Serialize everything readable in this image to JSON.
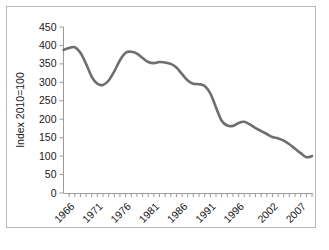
{
  "chart_data": {
    "type": "line",
    "title": "",
    "subtitle": "",
    "xlabel": "",
    "ylabel": "Index 2010=100",
    "ylim": [
      0,
      450
    ],
    "ytick_step": 50,
    "yticks": [
      "0",
      "50",
      "100",
      "150",
      "200",
      "250",
      "300",
      "350",
      "400",
      "450"
    ],
    "xlim": [
      1965,
      2009
    ],
    "xticks_labeled": [
      "1966",
      "1971",
      "1976",
      "1981",
      "1986",
      "1991",
      "1996",
      "2002",
      "2007"
    ],
    "xtick_values_labeled": [
      1966,
      1971,
      1976,
      1981,
      1986,
      1991,
      1996,
      2002,
      2007
    ],
    "minor_ticks_every": 1,
    "grid": false,
    "legend": null,
    "legend_position": "none",
    "line_color": "#6e6e6e",
    "axis_color": "#9a9a9a",
    "background": "#ffffff",
    "border_color": "#b9b9b9",
    "x": [
      1965,
      1966,
      1967,
      1968,
      1969,
      1970,
      1971,
      1972,
      1973,
      1974,
      1975,
      1976,
      1977,
      1978,
      1979,
      1980,
      1981,
      1982,
      1983,
      1984,
      1985,
      1986,
      1987,
      1988,
      1989,
      1990,
      1991,
      1992,
      1993,
      1994,
      1995,
      1996,
      1997,
      1998,
      1999,
      2000,
      2001,
      2002,
      2003,
      2004,
      2005,
      2006,
      2007,
      2008,
      2009
    ],
    "values": [
      388,
      393,
      395,
      380,
      350,
      315,
      296,
      293,
      305,
      330,
      360,
      380,
      383,
      378,
      366,
      355,
      352,
      355,
      354,
      350,
      340,
      322,
      305,
      296,
      295,
      290,
      270,
      232,
      196,
      183,
      182,
      190,
      193,
      186,
      176,
      168,
      160,
      152,
      148,
      142,
      132,
      120,
      108,
      97,
      100
    ],
    "series": [
      {
        "name": "Index 2010=100",
        "values": [
          388,
          393,
          395,
          380,
          350,
          315,
          296,
          293,
          305,
          330,
          360,
          380,
          383,
          378,
          366,
          355,
          352,
          355,
          354,
          350,
          340,
          322,
          305,
          296,
          295,
          290,
          270,
          232,
          196,
          183,
          182,
          190,
          193,
          186,
          176,
          168,
          160,
          152,
          148,
          142,
          132,
          120,
          108,
          97,
          100
        ]
      }
    ]
  }
}
